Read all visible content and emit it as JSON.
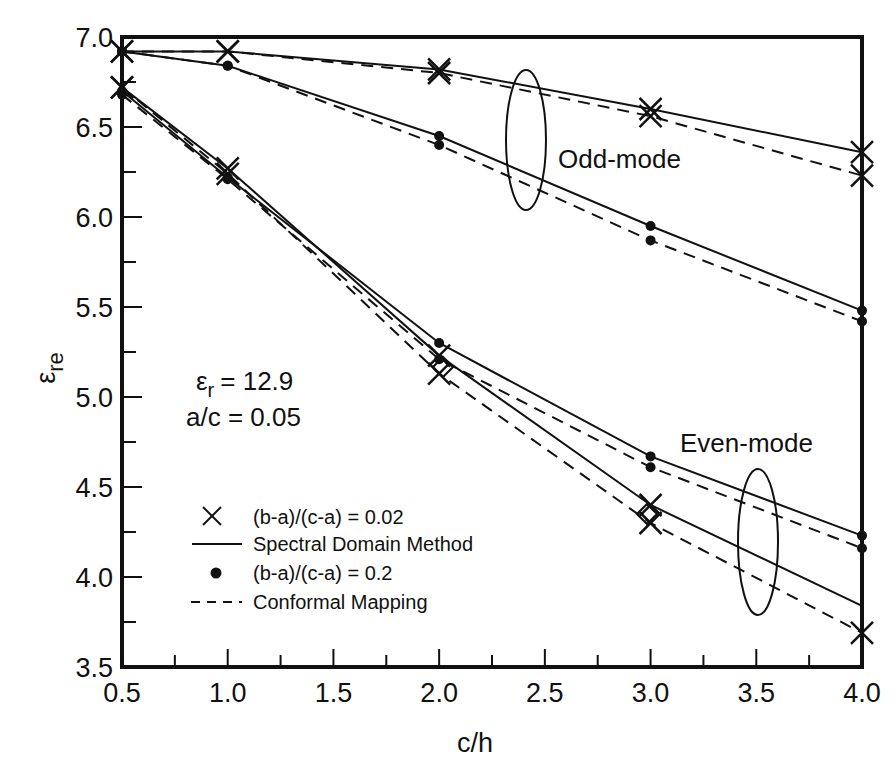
{
  "chart_data": {
    "type": "line",
    "title": "",
    "xlabel": "c/h",
    "ylabel": "ε_re",
    "xlim": [
      0.5,
      4.0
    ],
    "ylim": [
      3.5,
      7.0
    ],
    "grid": false,
    "x_ticks": [
      "0.5",
      "1.0",
      "1.5",
      "2.0",
      "2.5",
      "3.0",
      "3.5",
      "4.0"
    ],
    "y_ticks": [
      "3.5",
      "4.0",
      "4.5",
      "5.0",
      "5.5",
      "6.0",
      "6.5",
      "7.0"
    ],
    "x": [
      0.5,
      1.0,
      2.0,
      3.0,
      4.0
    ],
    "series": [
      {
        "name": "Odd-mode, (b-a)/(c-a) = 0.02, Spectral Domain Method",
        "mode": "odd",
        "marker": "x",
        "style": "solid",
        "values": [
          6.92,
          6.92,
          6.82,
          6.6,
          6.36
        ]
      },
      {
        "name": "Odd-mode, (b-a)/(c-a) = 0.02, Conformal Mapping",
        "mode": "odd",
        "marker": "x",
        "style": "dashed",
        "values": [
          6.92,
          6.92,
          6.8,
          6.56,
          6.23
        ]
      },
      {
        "name": "Odd-mode, (b-a)/(c-a) = 0.2, Spectral Domain Method",
        "mode": "odd",
        "marker": "dot",
        "style": "solid",
        "values": [
          6.92,
          6.84,
          6.45,
          5.95,
          5.48
        ]
      },
      {
        "name": "Odd-mode, (b-a)/(c-a) = 0.2, Conformal Mapping",
        "mode": "odd",
        "marker": "dot",
        "style": "dashed",
        "values": [
          6.92,
          6.84,
          6.4,
          5.87,
          5.42
        ]
      },
      {
        "name": "Even-mode, (b-a)/(c-a) = 0.02, Spectral Domain Method",
        "mode": "even",
        "marker": "x",
        "style": "solid",
        "values": [
          6.72,
          6.27,
          5.23,
          4.4,
          3.84
        ]
      },
      {
        "name": "Even-mode, (b-a)/(c-a) = 0.02, Conformal Mapping",
        "mode": "even",
        "marker": "x",
        "style": "dashed",
        "values": [
          6.72,
          6.24,
          5.13,
          4.3,
          3.69
        ]
      },
      {
        "name": "Even-mode, (b-a)/(c-a) = 0.2, Spectral Domain Method",
        "mode": "even",
        "marker": "dot",
        "style": "solid",
        "values": [
          6.7,
          6.22,
          5.3,
          4.67,
          4.23
        ]
      },
      {
        "name": "Even-mode, (b-a)/(c-a) = 0.2, Conformal Mapping",
        "mode": "even",
        "marker": "dot",
        "style": "dashed",
        "values": [
          6.68,
          6.21,
          5.21,
          4.61,
          4.16
        ]
      }
    ],
    "annotations": {
      "odd_mode_label": "Odd-mode",
      "even_mode_label": "Even-mode",
      "param_er": "= 12.9",
      "param_er_symbol": "ε",
      "param_er_sub": "r",
      "param_ac": "a/c = 0.05"
    },
    "legend": {
      "position": "lower-left",
      "entries": [
        {
          "symbol": "x",
          "label": "(b-a)/(c-a) = 0.02"
        },
        {
          "symbol": "solid-line",
          "label": "Spectral Domain Method"
        },
        {
          "symbol": "dot",
          "label": "(b-a)/(c-a) = 0.2"
        },
        {
          "symbol": "dashed-line",
          "label": "Conformal Mapping"
        }
      ]
    }
  },
  "axes": {
    "x_title": "c/h",
    "y_title_main": "ε",
    "y_title_sub": "re"
  }
}
